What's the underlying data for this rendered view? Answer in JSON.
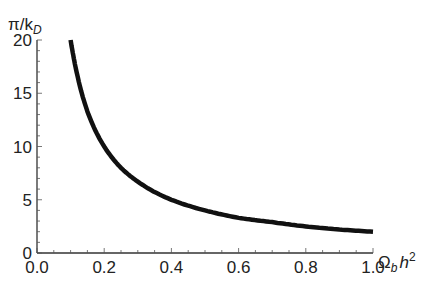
{
  "chart_data": {
    "type": "line",
    "title": "",
    "xlabel": "Ω_b h²",
    "ylabel": "π/k_D",
    "xlim": [
      0.0,
      1.0
    ],
    "ylim": [
      0,
      20
    ],
    "x_ticks": [
      "0.0",
      "0.2",
      "0.4",
      "0.6",
      "0.8",
      "1.0"
    ],
    "y_ticks": [
      "0",
      "5",
      "10",
      "15",
      "20"
    ],
    "grid": false,
    "legend": null,
    "series": [
      {
        "name": "π/k_D",
        "color": "#111111",
        "x": [
          0.1,
          0.12,
          0.15,
          0.2,
          0.25,
          0.3,
          0.4,
          0.5,
          0.6,
          0.7,
          0.8,
          0.9,
          1.0
        ],
        "values": [
          20,
          16.7,
          13.3,
          10,
          8,
          6.7,
          5,
          4,
          3.3,
          2.9,
          2.5,
          2.2,
          2.0
        ]
      }
    ]
  },
  "labels": {
    "y_axis_main": "π/k",
    "y_axis_sub": "D",
    "x_axis_main": "Ω",
    "x_axis_sub": "b",
    "x_axis_h": "h",
    "x_axis_sup": "2"
  }
}
